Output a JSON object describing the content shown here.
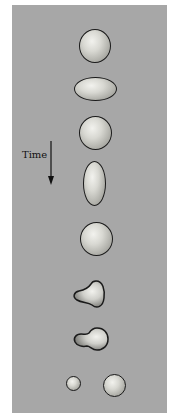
{
  "diagram": {
    "time_label": "Time",
    "stages": [
      {
        "index": 1,
        "shape": "sphere"
      },
      {
        "index": 2,
        "shape": "oblate-ellipsoid"
      },
      {
        "index": 3,
        "shape": "sphere"
      },
      {
        "index": 4,
        "shape": "prolate-ellipsoid"
      },
      {
        "index": 5,
        "shape": "sphere"
      },
      {
        "index": 6,
        "shape": "pear-shaped"
      },
      {
        "index": 7,
        "shape": "necked-dumbbell"
      },
      {
        "index": 8,
        "shape": "two-separated-droplets"
      }
    ],
    "colors": {
      "background": "#a7a7a7",
      "outline": "#1a1a1a"
    }
  }
}
